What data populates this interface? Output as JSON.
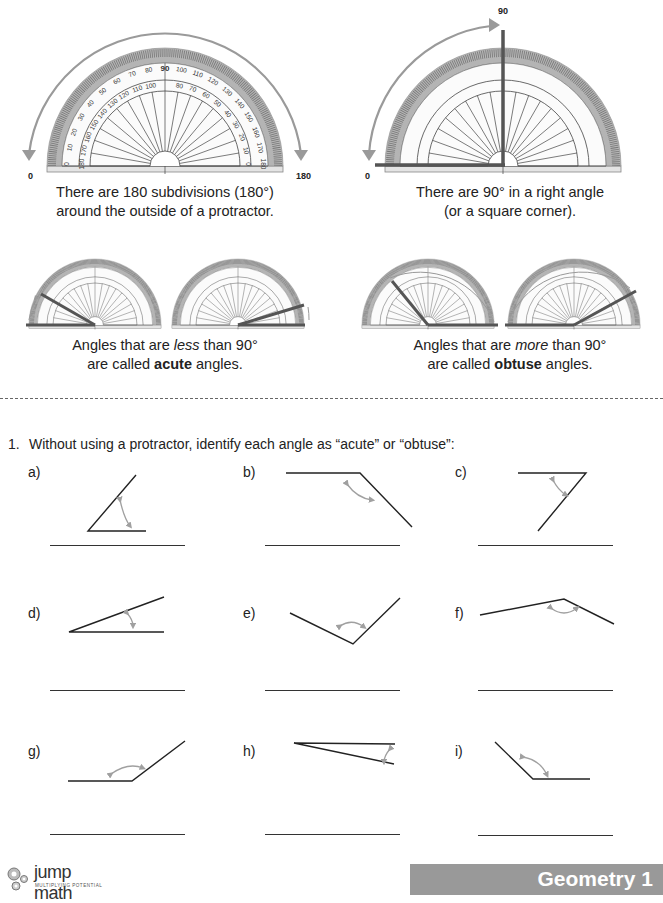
{
  "intro": {
    "protractor_full": {
      "start_label": "0",
      "end_label": "180",
      "caption_line1": "There are 180 subdivisions (180°)",
      "caption_line2": "around the outside of a protractor."
    },
    "protractor_right": {
      "start_label": "0",
      "top_label": "90",
      "caption_line1": "There are 90° in a right angle",
      "caption_line2": "(or a square corner)."
    },
    "acute": {
      "caption_pre": "Angles that are ",
      "caption_em": "less",
      "caption_post": " than 90°",
      "caption2_pre": "are called ",
      "caption2_bold": "acute",
      "caption2_post": " angles."
    },
    "obtuse": {
      "caption_pre": "Angles that are ",
      "caption_em": "more",
      "caption_post": " than 90°",
      "caption2_pre": "are called ",
      "caption2_bold": "obtuse",
      "caption2_post": " angles."
    },
    "protractor_scale": {
      "outer": [
        "0",
        "10",
        "20",
        "30",
        "40",
        "50",
        "60",
        "70",
        "80",
        "90",
        "100",
        "110",
        "120",
        "130",
        "140",
        "150",
        "160",
        "170",
        "180"
      ],
      "inner": [
        "180",
        "170",
        "160",
        "150",
        "140",
        "130",
        "120",
        "110",
        "100",
        "90",
        "80",
        "70",
        "60",
        "50",
        "40",
        "30",
        "20",
        "10",
        "0"
      ]
    }
  },
  "question": {
    "number": "1.",
    "text": "Without using a protractor, identify each angle as “acute” or “obtuse”:",
    "items": [
      {
        "label": "a)",
        "answer": ""
      },
      {
        "label": "b)",
        "answer": ""
      },
      {
        "label": "c)",
        "answer": ""
      },
      {
        "label": "d)",
        "answer": ""
      },
      {
        "label": "e)",
        "answer": ""
      },
      {
        "label": "f)",
        "answer": ""
      },
      {
        "label": "g)",
        "answer": ""
      },
      {
        "label": "h)",
        "answer": ""
      },
      {
        "label": "i)",
        "answer": ""
      }
    ]
  },
  "footer": {
    "logo_text": "jump math",
    "logo_tagline": "MULTIPLYING POTENTIAL",
    "section": "Geometry 1"
  },
  "colors": {
    "arrow_gray": "#9a9a9a",
    "ray_dark": "#555555",
    "protractor_band": "#aaaaaa",
    "footer_band": "#999999"
  }
}
